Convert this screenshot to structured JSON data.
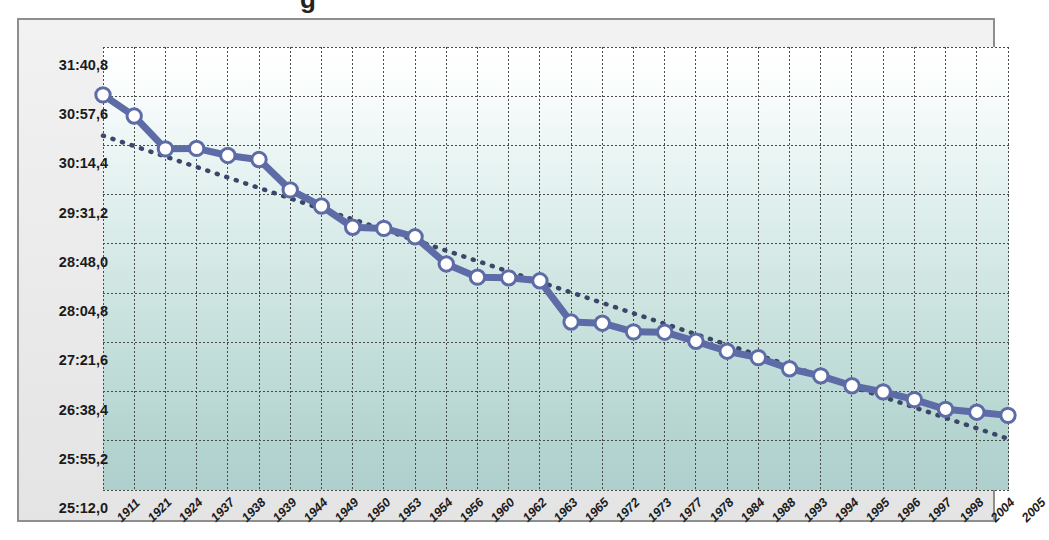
{
  "figure": {
    "title_sliver": "g",
    "frame_border_color": "#8e8e8e",
    "panel_background": "#ededed"
  },
  "chart_data": {
    "type": "line",
    "title": "",
    "subtitle": "",
    "xlabel": "",
    "ylabel": "",
    "grid": true,
    "legend": "none",
    "value_format": "mm:ss,t",
    "categories": [
      "1911",
      "1921",
      "1924",
      "1937",
      "1938",
      "1939",
      "1944",
      "1949",
      "1950",
      "1953",
      "1954",
      "1956",
      "1960",
      "1962",
      "1963",
      "1965",
      "1972",
      "1973",
      "1977",
      "1978",
      "1984",
      "1988",
      "1993",
      "1994",
      "1995",
      "1996",
      "1997",
      "1998",
      "2004",
      "2005"
    ],
    "ytick_labels": [
      "25:12,0",
      "25:55,2",
      "26:38,4",
      "27:21,6",
      "28:04,8",
      "28:48,0",
      "29:31,2",
      "30:14,4",
      "30:57,6",
      "31:40,8"
    ],
    "ytick_seconds": [
      1512.0,
      1555.2,
      1598.4,
      1641.6,
      1684.8,
      1728.0,
      1771.2,
      1814.4,
      1857.6,
      1900.8
    ],
    "ylim_seconds": [
      1512.0,
      1900.8
    ],
    "series": [
      {
        "name": "record",
        "style": "line-with-markers",
        "color": "#5d6ca6",
        "marker_fill": "#ffffff",
        "values_label": [
          "30:58,8",
          "30:40,2",
          "30:11,4",
          "30:11,8",
          "30:05,6",
          "30:02,0",
          "29:35,4",
          "29:21,2",
          "29:02,6",
          "29:01,6",
          "28:54,2",
          "28:30,4",
          "28:18,8",
          "28:18,2",
          "28:15,6",
          "27:39,4",
          "27:38,4",
          "27:30,8",
          "27:30,5",
          "27:22,5",
          "27:13,8",
          "27:08,2",
          "26:58,4",
          "26:52,2",
          "26:43,5",
          "26:38,1",
          "26:31,3",
          "26:22,8",
          "26:20,3",
          "26:17,5"
        ],
        "values_seconds": [
          1858.8,
          1840.2,
          1811.4,
          1811.8,
          1805.6,
          1802.0,
          1775.4,
          1761.2,
          1742.6,
          1741.6,
          1734.2,
          1710.4,
          1698.8,
          1698.2,
          1695.6,
          1659.4,
          1658.4,
          1650.8,
          1650.5,
          1642.5,
          1633.8,
          1628.2,
          1618.4,
          1612.2,
          1603.5,
          1598.1,
          1591.3,
          1582.8,
          1580.3,
          1577.5
        ]
      },
      {
        "name": "trendline",
        "style": "dotted",
        "color": "#3c4668",
        "start_seconds": 1823.0,
        "end_seconds": 1557.0
      }
    ]
  }
}
